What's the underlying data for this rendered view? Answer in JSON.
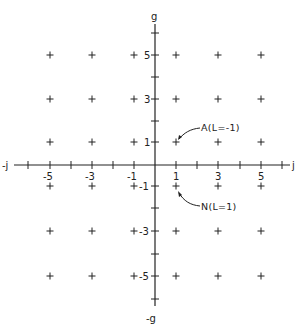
{
  "diagram": {
    "type": "lattice",
    "axes": {
      "horizontal": {
        "positive_label": "j",
        "negative_label": "-j"
      },
      "vertical": {
        "positive_label": "g",
        "negative_label": "-g"
      }
    },
    "x_tick_labels": [
      "-5",
      "-3",
      "-1",
      "1",
      "3",
      "5"
    ],
    "y_tick_labels": [
      "5",
      "3",
      "1",
      "-1",
      "-3",
      "-5"
    ],
    "lattice_points": {
      "j_values": [
        -5,
        -3,
        -1,
        1,
        3,
        5
      ],
      "g_values": [
        5,
        3,
        1,
        -1,
        -3,
        -5
      ],
      "marker": "+"
    },
    "annotations": [
      {
        "label": "A(L=-1)",
        "point": {
          "j": 1,
          "g": 1
        }
      },
      {
        "label": "N(L=1)",
        "point": {
          "j": 1,
          "g": -1
        }
      }
    ]
  }
}
